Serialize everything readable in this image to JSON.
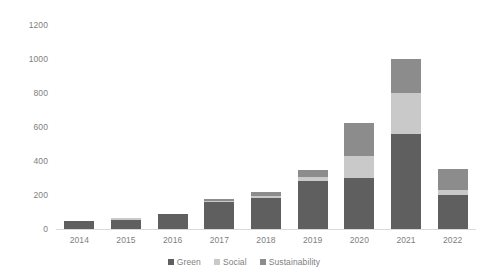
{
  "chart_data": {
    "type": "bar",
    "stacked": true,
    "title": "",
    "subtitle": "",
    "xlabel": "",
    "ylabel": "",
    "categories": [
      "2014",
      "2015",
      "2016",
      "2017",
      "2018",
      "2019",
      "2020",
      "2021",
      "2022"
    ],
    "series": [
      {
        "name": "Green",
        "color": "#5f5f5f",
        "values": [
          47,
          52,
          88,
          160,
          185,
          280,
          300,
          560,
          200
        ]
      },
      {
        "name": "Social",
        "color": "#c9c9c9",
        "values": [
          0,
          13,
          0,
          6,
          12,
          26,
          130,
          240,
          30
        ]
      },
      {
        "name": "Sustainability",
        "color": "#8c8c8c",
        "values": [
          0,
          0,
          0,
          10,
          18,
          44,
          195,
          200,
          125
        ]
      }
    ],
    "ylim": [
      0,
      1200
    ],
    "yticks": [
      0,
      200,
      400,
      600,
      800,
      1000,
      1200
    ],
    "ytick_labels": [
      "0",
      "200",
      "400",
      "600",
      "800",
      "1000",
      "1200"
    ],
    "grid": false,
    "legend_position": "bottom",
    "axis_color": "#d9d9d9",
    "tick_label_color": "#808080",
    "background": "#ffffff"
  }
}
